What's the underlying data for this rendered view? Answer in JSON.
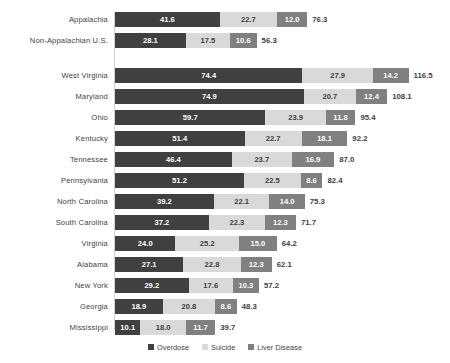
{
  "chart_data": {
    "type": "bar",
    "subtype": "stacked-horizontal",
    "title": "",
    "xlabel": "",
    "ylabel": "",
    "grid": false,
    "legend_position": "bottom",
    "xlim": [
      0,
      116.5
    ],
    "px_per_unit": 2.52,
    "categories": [
      "Appalachia",
      "Non-Appalachian U.S.",
      "West Virginia",
      "Maryland",
      "Ohio",
      "Kentucky",
      "Tennessee",
      "Pennsylvania",
      "North Carolina",
      "South Carolina",
      "Virginia",
      "Alabama",
      "New York",
      "Georgia",
      "Mississippi"
    ],
    "group_break_after_index": 1,
    "series": [
      {
        "name": "Overdose",
        "color": "#404040",
        "values": [
          41.6,
          28.1,
          74.4,
          74.9,
          59.7,
          51.4,
          46.4,
          51.2,
          39.2,
          37.2,
          24.0,
          27.1,
          29.2,
          18.9,
          10.1
        ]
      },
      {
        "name": "Suicide",
        "color": "#d9d9d9",
        "values": [
          22.7,
          17.5,
          27.9,
          20.7,
          23.9,
          22.7,
          23.7,
          22.5,
          22.1,
          22.3,
          25.2,
          22.8,
          17.6,
          20.8,
          18.0
        ]
      },
      {
        "name": "Liver Disease",
        "color": "#808080",
        "values": [
          12.0,
          10.6,
          14.2,
          12.4,
          11.8,
          18.1,
          16.9,
          8.6,
          14.0,
          12.3,
          15.0,
          12.3,
          10.3,
          8.6,
          11.7
        ]
      }
    ],
    "totals": [
      76.3,
      56.3,
      116.5,
      108.1,
      95.4,
      92.2,
      87.0,
      82.4,
      75.3,
      71.7,
      64.2,
      62.1,
      57.2,
      48.3,
      39.7
    ]
  },
  "legend": {
    "items": [
      {
        "label": "Overdose",
        "color": "#404040",
        "swatch": "legend-swatch-overdose"
      },
      {
        "label": "Suicide",
        "color": "#d9d9d9",
        "swatch": "legend-swatch-suicide"
      },
      {
        "label": "Liver Disease",
        "color": "#808080",
        "swatch": "legend-swatch-liver-disease"
      }
    ]
  }
}
